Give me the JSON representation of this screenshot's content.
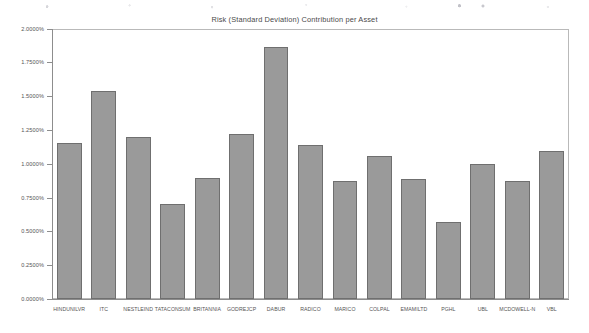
{
  "chart_data": {
    "type": "bar",
    "title": "Risk (Standard Deviation) Contribution per Asset",
    "xlabel": "",
    "ylabel": "",
    "ylim": [
      0,
      0.02
    ],
    "grid": false,
    "legend": null,
    "tick_format": "percent-4dp",
    "categories": [
      "HINDUNILVR",
      "ITC",
      "NESTLEIND",
      "TATACONSUM",
      "BRITANNIA",
      "GODREJCP",
      "DABUR",
      "RADICO",
      "MARICO",
      "COLPAL",
      "EMAMILTD",
      "PGHL",
      "UBL",
      "MCDOWELL-N",
      "VBL"
    ],
    "values": [
      1.152,
      1.537,
      1.199,
      0.703,
      0.893,
      1.219,
      1.866,
      1.14,
      0.875,
      1.06,
      0.888,
      0.572,
      0.996,
      0.875,
      1.095
    ],
    "value_unit": "%",
    "ytick_labels": [
      "0.0000%",
      "0.2500%",
      "0.5000%",
      "0.7500%",
      "1.0000%",
      "1.2500%",
      "1.5000%",
      "1.7500%",
      "2.0000%"
    ],
    "ytick_values": [
      0.0,
      0.25,
      0.5,
      0.75,
      1.0,
      1.25,
      1.5,
      1.75,
      2.0
    ],
    "bar_color": "#9a9a9a",
    "bar_edge_color": "#6f6f6f",
    "axis_color": "#8d8d8d",
    "frame_color": "#b9b9b9",
    "background": "#ffffff"
  }
}
